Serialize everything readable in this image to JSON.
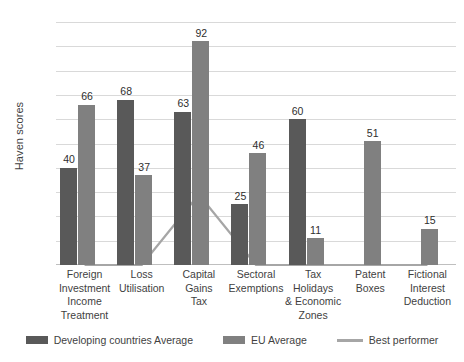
{
  "chart_data": {
    "type": "bar",
    "title": "",
    "xlabel": "",
    "ylabel": "Haven scores",
    "ylim": [
      0,
      100
    ],
    "ytick_step": 10,
    "yticks": [
      0,
      10,
      20,
      30,
      40,
      50,
      60,
      70,
      80,
      90,
      100
    ],
    "grid": "horizontal",
    "legend_position": "bottom",
    "categories": [
      "Foreign Investment Income Treatment",
      "Loss Utilisation",
      "Capital Gains Tax",
      "Sectoral Exemptions",
      "Tax Holidays & Economic Zones",
      "Patent Boxes",
      "Fictional Interest Deduction"
    ],
    "category_lines": [
      [
        "Foreign",
        "Investment",
        "Income",
        "Treatment"
      ],
      [
        "Loss",
        "Utilisation"
      ],
      [
        "Capital Gains",
        "Tax"
      ],
      [
        "Sectoral",
        "Exemptions"
      ],
      [
        "Tax Holidays",
        "& Economic",
        "Zones"
      ],
      [
        "Patent Boxes"
      ],
      [
        "Fictional",
        "Interest",
        "Deduction"
      ]
    ],
    "series": [
      {
        "name": "Developing countries Average",
        "kind": "bar",
        "color": "#595959",
        "values": [
          40,
          68,
          63,
          25,
          60,
          null,
          null
        ],
        "labels": [
          "40",
          "68",
          "63",
          "25",
          "60",
          "",
          ""
        ]
      },
      {
        "name": "EU Average",
        "kind": "bar",
        "color": "#808080",
        "values": [
          66,
          37,
          92,
          46,
          11,
          51,
          15
        ],
        "labels": [
          "66",
          "37",
          "92",
          "46",
          "11",
          "51",
          "15"
        ]
      },
      {
        "name": "Best performer",
        "kind": "line",
        "color": "#a6a6a6",
        "values": [
          0,
          0,
          29,
          0,
          0,
          0,
          0
        ],
        "labels": [
          "",
          "",
          "",
          "",
          "",
          "",
          ""
        ]
      }
    ]
  },
  "axis": {
    "y_title": "Haven scores",
    "tick_labels": [
      "100",
      "90",
      "80",
      "70",
      "60",
      "50",
      "40",
      "30",
      "20",
      "10",
      "0"
    ]
  },
  "legend": {
    "items": [
      {
        "label": "Developing countries Average",
        "marker": "swatch",
        "color": "#595959"
      },
      {
        "label": "EU Average",
        "marker": "swatch",
        "color": "#808080"
      },
      {
        "label": "Best performer",
        "marker": "line",
        "color": "#a6a6a6"
      }
    ]
  }
}
